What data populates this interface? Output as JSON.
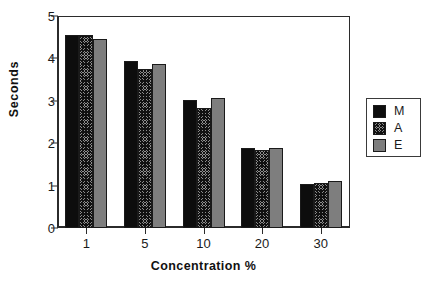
{
  "chart_data": {
    "type": "bar",
    "title": "",
    "xlabel": "Concentration %",
    "ylabel": "Seconds",
    "categories": [
      "1",
      "5",
      "10",
      "20",
      "30"
    ],
    "series": [
      {
        "name": "M",
        "values": [
          4.55,
          3.93,
          3.01,
          1.88,
          1.04
        ],
        "color": "#0d0d0d",
        "fill": "solid-black"
      },
      {
        "name": "A",
        "values": [
          4.55,
          3.74,
          2.84,
          1.85,
          1.07
        ],
        "color": "#8d8d8d",
        "fill": "crosshatch"
      },
      {
        "name": "E",
        "values": [
          4.45,
          3.86,
          3.06,
          1.88,
          1.11
        ],
        "color": "#7e7e7e",
        "fill": "solid-gray"
      }
    ],
    "ylim": [
      0,
      5
    ],
    "yticks": [
      0,
      1,
      2,
      3,
      4,
      5
    ],
    "ytick_labels": [
      "0",
      "1",
      "2",
      "3",
      "4",
      "5"
    ],
    "grid": false,
    "legend_position": "right",
    "legend_entries": [
      "M",
      "A",
      "E"
    ]
  },
  "axes": {
    "y_title": "Seconds",
    "x_title": "Concentration %"
  }
}
